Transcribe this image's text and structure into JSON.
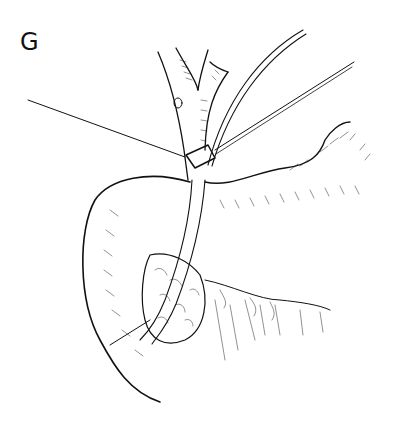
{
  "figure": {
    "panel_label": "G",
    "colors": {
      "background": "#ffffff",
      "ink": "#111111"
    }
  }
}
